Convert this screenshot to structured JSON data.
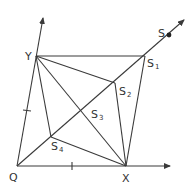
{
  "diagram": {
    "type": "geometric-construction",
    "colors": {
      "line": "#3a3a3a",
      "text": "#333333",
      "background": "#ffffff"
    },
    "labels": {
      "Q": "Q",
      "X": "X",
      "Y": "Y",
      "S": "S",
      "S1": {
        "base": "S",
        "sub": "1"
      },
      "S2": {
        "base": "S",
        "sub": "2"
      },
      "S3": {
        "base": "S",
        "sub": "3"
      },
      "S4": {
        "base": "S",
        "sub": "4"
      }
    },
    "points": [
      "Q",
      "X",
      "Y",
      "S",
      "S1",
      "S2",
      "S3",
      "S4"
    ],
    "segments": [
      [
        "Q",
        "X"
      ],
      [
        "Q",
        "Y"
      ],
      [
        "Y",
        "S1"
      ],
      [
        "S1",
        "X"
      ],
      [
        "Y",
        "S2"
      ],
      [
        "S2",
        "X"
      ],
      [
        "Y",
        "X"
      ],
      [
        "Y",
        "S4"
      ],
      [
        "S4",
        "X"
      ],
      [
        "Q",
        "S"
      ]
    ],
    "arrows": [
      "x-axis",
      "y-axis",
      "diagonal-ray"
    ],
    "tick_marks": [
      "QX-midpoint",
      "QY-midpoint"
    ],
    "marked_point": "S"
  }
}
